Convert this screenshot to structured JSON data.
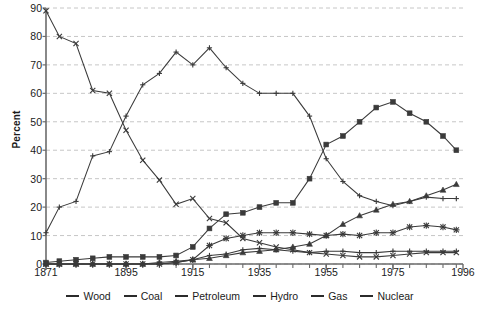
{
  "chart_data": {
    "type": "line",
    "title": "",
    "xlabel": "",
    "ylabel": "Percent",
    "xlim": [
      1871,
      1996
    ],
    "ylim": [
      0,
      90
    ],
    "yticks": [
      0,
      10,
      20,
      30,
      40,
      50,
      60,
      70,
      80,
      90
    ],
    "xticks": [
      1871,
      1895,
      1915,
      1935,
      1955,
      1975,
      1996
    ],
    "grid": "horizontal-dashed",
    "legend_position": "bottom",
    "x": [
      1871,
      1875,
      1880,
      1885,
      1890,
      1895,
      1900,
      1905,
      1910,
      1915,
      1920,
      1925,
      1930,
      1935,
      1940,
      1945,
      1950,
      1955,
      1960,
      1965,
      1970,
      1975,
      1980,
      1985,
      1990,
      1994
    ],
    "series": [
      {
        "name": "Wood",
        "marker": "x",
        "values": [
          89,
          80,
          77.5,
          61,
          60,
          47,
          36.5,
          29.5,
          21,
          23,
          16,
          14.5,
          9,
          7.5,
          6,
          5,
          4,
          3.5,
          3,
          2.5,
          2.5,
          3,
          3.5,
          4,
          4,
          4
        ]
      },
      {
        "name": "Coal",
        "marker": "plus",
        "values": [
          11,
          20,
          22,
          38,
          39.5,
          52,
          63,
          67,
          74.5,
          70,
          76,
          69,
          63.5,
          60,
          60,
          60,
          52,
          37,
          29,
          24,
          22,
          20.5,
          22,
          23.5,
          23,
          23
        ]
      },
      {
        "name": "Petroleum",
        "marker": "square",
        "values": [
          0.5,
          1,
          1.5,
          2,
          2.5,
          2.5,
          2.5,
          2.5,
          3,
          6,
          12.5,
          17.5,
          18,
          20,
          21.5,
          21.5,
          30,
          42,
          45,
          50,
          55,
          57,
          53,
          50,
          45,
          40
        ]
      },
      {
        "name": "Hydro",
        "marker": "plus",
        "values": [
          0,
          0,
          0,
          0,
          0,
          0,
          0,
          0,
          0.5,
          1.5,
          3,
          3.5,
          5,
          5.5,
          5,
          4.5,
          4,
          4.5,
          4.5,
          4,
          4,
          4.5,
          4.5,
          4.5,
          4.5,
          4.5
        ]
      },
      {
        "name": "Gas",
        "marker": "triangle",
        "values": [
          0,
          0,
          0,
          0,
          0,
          0,
          0,
          0.5,
          1,
          1.5,
          2,
          3,
          4,
          4.5,
          5,
          6,
          7,
          10,
          14,
          17,
          19,
          21,
          22,
          24,
          26,
          28
        ]
      },
      {
        "name": "Nuclear",
        "marker": "star",
        "values": [
          0,
          0,
          0,
          0,
          0,
          0,
          0,
          0,
          0.5,
          1.5,
          6.5,
          9,
          10,
          11,
          11,
          11,
          10.5,
          10,
          10.5,
          10,
          11,
          11,
          13,
          13.5,
          13,
          12
        ]
      }
    ]
  },
  "axis": {
    "y_title": "Percent",
    "y_tick_labels": [
      "0",
      "10",
      "20",
      "30",
      "40",
      "50",
      "60",
      "70",
      "80",
      "90"
    ],
    "x_tick_labels": [
      "1871",
      "1895",
      "1915",
      "1935",
      "1955",
      "1975",
      "1996"
    ]
  },
  "legend": {
    "items": [
      {
        "label": "Wood"
      },
      {
        "label": "Coal"
      },
      {
        "label": "Petroleum"
      },
      {
        "label": "Hydro"
      },
      {
        "label": "Gas"
      },
      {
        "label": "Nuclear"
      }
    ]
  },
  "colors": {
    "line": "#3a3a3a",
    "axis": "#6b6b6b",
    "grid": "#b8b8b8",
    "text": "#1b1b1b",
    "background": "#ffffff"
  }
}
